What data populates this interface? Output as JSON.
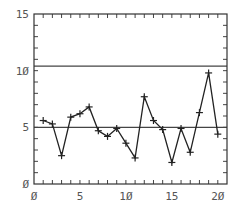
{
  "chart_data": {
    "type": "line",
    "title": "",
    "xlabel": "",
    "ylabel": "",
    "xlim": [
      0,
      21
    ],
    "ylim": [
      0,
      15
    ],
    "grid": false,
    "legend": null,
    "x_ticks": [
      0,
      5,
      10,
      15,
      20
    ],
    "x_tick_labels": [
      "Ø",
      "5",
      "1Ø",
      "15",
      "2Ø"
    ],
    "y_ticks": [
      0,
      5,
      10,
      15
    ],
    "y_tick_labels": [
      "Ø",
      "5",
      "1Ø",
      "15"
    ],
    "minor_tick_step": 1,
    "series": [
      {
        "name": "data",
        "marker": "+",
        "x": [
          1,
          2,
          3,
          4,
          5,
          6,
          7,
          8,
          9,
          10,
          11,
          12,
          13,
          14,
          15,
          16,
          17,
          18,
          19,
          20
        ],
        "values": [
          5.6,
          5.3,
          2.5,
          5.9,
          6.2,
          6.8,
          4.7,
          4.2,
          4.9,
          3.6,
          2.3,
          7.7,
          5.6,
          4.8,
          1.9,
          4.9,
          2.8,
          6.3,
          9.8,
          4.4
        ]
      }
    ],
    "reference_lines": [
      {
        "name": "upper-limit",
        "y": 10.4
      },
      {
        "name": "center-line",
        "y": 5.0
      }
    ]
  }
}
